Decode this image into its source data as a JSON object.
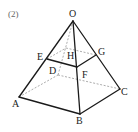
{
  "problem_number": "(2)",
  "figure": {
    "type": "square pyramid with cross-section",
    "colors": {
      "visible_edge": "#1a1a1a",
      "hidden_edge": "#888888",
      "label": "#222222",
      "number": "#666666"
    },
    "points": {
      "O": {
        "label": "O",
        "x": 73,
        "y": 21,
        "lx": 69,
        "ly": 17
      },
      "A": {
        "label": "A",
        "x": 19,
        "y": 97,
        "lx": 12,
        "ly": 107
      },
      "B": {
        "label": "B",
        "x": 80,
        "y": 114,
        "lx": 76,
        "ly": 124
      },
      "C": {
        "label": "C",
        "x": 120,
        "y": 89,
        "lx": 121,
        "ly": 95
      },
      "D": {
        "label": "D",
        "x": 58,
        "y": 75,
        "lx": 49,
        "ly": 74
      },
      "E": {
        "label": "E",
        "x": 47,
        "y": 59,
        "lx": 37,
        "ly": 60
      },
      "F": {
        "label": "F",
        "x": 77,
        "y": 67,
        "lx": 82,
        "ly": 78
      },
      "G": {
        "label": "G",
        "x": 96,
        "y": 55,
        "lx": 98,
        "ly": 55
      },
      "H": {
        "label": "H",
        "x": 66,
        "y": 48,
        "lx": 67,
        "ly": 59
      }
    },
    "visible_edges": [
      [
        "O",
        "A"
      ],
      [
        "O",
        "B"
      ],
      [
        "O",
        "C"
      ],
      [
        "A",
        "B"
      ],
      [
        "B",
        "C"
      ],
      [
        "E",
        "F"
      ],
      [
        "F",
        "G"
      ]
    ],
    "hidden_edges": [
      [
        "O",
        "D"
      ],
      [
        "A",
        "D"
      ],
      [
        "D",
        "C"
      ],
      [
        "E",
        "H"
      ],
      [
        "H",
        "G"
      ]
    ],
    "labels": [
      "O",
      "A",
      "B",
      "C",
      "D",
      "E",
      "F",
      "G",
      "H"
    ]
  }
}
